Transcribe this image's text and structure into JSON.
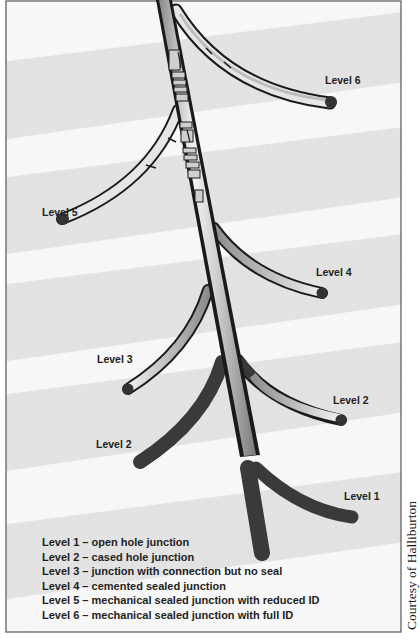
{
  "diagram": {
    "labels": {
      "level6": "Level 6",
      "level5": "Level 5",
      "level4": "Level 4",
      "level3": "Level 3",
      "level2_right": "Level 2",
      "level2_left": "Level 2",
      "level1": "Level 1"
    },
    "legend": [
      "Level 1 – open hole junction",
      "Level 2 – cased hole junction",
      "Level 3 – junction with connection but no seal",
      "Level 4 – cemented sealed junction",
      "Level 5 – mechanical sealed junction with reduced ID",
      "Level 6 – mechanical sealed junction with full ID"
    ],
    "credit": "Courtesy of Halliburton",
    "colors": {
      "band_dark": "#e2e2e2",
      "band_light": "#f7f7f7",
      "casing_outline": "#1a1a1a",
      "open_hole": "#3a3a3a",
      "steel_light": "#e8e8e8",
      "steel_mid": "#9a9a9a"
    }
  }
}
